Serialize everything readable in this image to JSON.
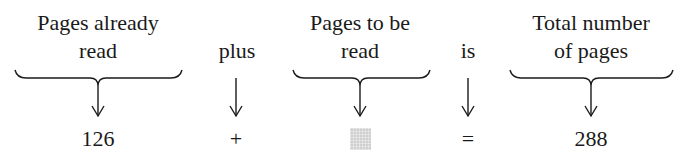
{
  "columns": [
    {
      "label_lines": [
        "Pages already",
        "read"
      ],
      "value": "126",
      "center_x": 98,
      "has_brace": true,
      "brace": [
        15,
        182
      ]
    },
    {
      "label_lines": [
        "plus"
      ],
      "value": "+",
      "center_x": 236,
      "has_brace": false
    },
    {
      "label_lines": [
        "Pages to be",
        "read"
      ],
      "value": "",
      "value_is_blank_box": true,
      "center_x": 360,
      "has_brace": true,
      "brace": [
        293,
        430
      ]
    },
    {
      "label_lines": [
        "is"
      ],
      "value": "=",
      "center_x": 468,
      "has_brace": false
    },
    {
      "label_lines": [
        "Total number",
        "of pages"
      ],
      "value": "288",
      "center_x": 591,
      "has_brace": true,
      "brace": [
        510,
        673
      ]
    }
  ],
  "colors": {
    "text": "#1a1a1a",
    "blank_box": "#cfcfcf",
    "background": "#ffffff"
  }
}
